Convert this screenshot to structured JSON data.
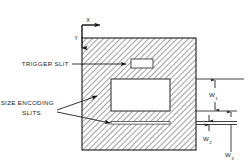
{
  "diagram": {
    "plate": {
      "name": "hatched-plate",
      "fill_pattern": "diagonal-hatch",
      "hatch_color": "#4a4a4a",
      "outline_color": "#1a1a1a"
    },
    "axes": {
      "x_label": "X",
      "y_label": "Y",
      "origin_note": "top-left corner of plate"
    },
    "labels": [
      {
        "id": "trigger-slit",
        "text": "TRIGGER SLIT",
        "lines": [
          "TRIGGER SLIT"
        ]
      },
      {
        "id": "size-encoding-slits",
        "text": "SIZE ENCODING SLITS",
        "lines": [
          "SIZE ENCODING",
          "SLITS"
        ]
      }
    ],
    "dimensions": [
      {
        "id": "w1",
        "base": "W",
        "subscript": "1"
      },
      {
        "id": "w2",
        "base": "W",
        "subscript": "2"
      },
      {
        "id": "w3",
        "base": "W",
        "subscript": "3"
      }
    ],
    "openings": [
      {
        "id": "trigger-slit-opening",
        "shape": "small-rectangle"
      },
      {
        "id": "large-encoding-opening",
        "shape": "large-rectangle"
      },
      {
        "id": "thin-encoding-slit",
        "shape": "thin-horizontal-slit"
      }
    ]
  }
}
